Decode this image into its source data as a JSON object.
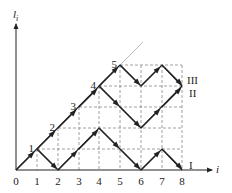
{
  "axes": {
    "y_label": "l",
    "y_label_sub": "i",
    "x_label": "i",
    "x_ticks": [
      "0",
      "1",
      "2",
      "3",
      "4",
      "5",
      "6",
      "7",
      "8"
    ]
  },
  "diagonal_points": [
    {
      "i": 1,
      "label": "1"
    },
    {
      "i": 2,
      "label": "2"
    },
    {
      "i": 3,
      "label": "3"
    },
    {
      "i": 4,
      "label": "4"
    },
    {
      "i": 5,
      "label": "5"
    }
  ],
  "paths": [
    {
      "name": "I",
      "points": [
        [
          0,
          0
        ],
        [
          1,
          1
        ],
        [
          2,
          0
        ],
        [
          4,
          2
        ],
        [
          6,
          0
        ],
        [
          7,
          1
        ],
        [
          8,
          0
        ]
      ]
    },
    {
      "name": "II",
      "points": [
        [
          4,
          4
        ],
        [
          6,
          2
        ],
        [
          8,
          4
        ]
      ]
    },
    {
      "name": "III",
      "points": [
        [
          5,
          5
        ],
        [
          6,
          4
        ],
        [
          7,
          5
        ],
        [
          8,
          4
        ]
      ]
    }
  ],
  "path_labels": {
    "I": "I",
    "II": "II",
    "III": "III"
  },
  "colors": {
    "line": "#222222",
    "grid": "#888888",
    "extension": "#aaaaaa"
  }
}
